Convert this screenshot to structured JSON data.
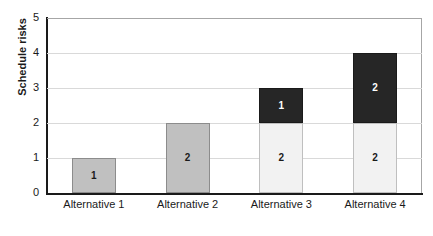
{
  "chart_data": {
    "type": "bar",
    "title": "",
    "xlabel": "",
    "ylabel": "Schedule risks",
    "ylim": [
      0,
      5
    ],
    "yticks": [
      "0",
      "1",
      "2",
      "3",
      "4",
      "5"
    ],
    "grid": true,
    "legend": "none",
    "stacked": true,
    "categories": [
      "Alternative 1",
      "Alternative 2",
      "Alternative 3",
      "Alternative 4"
    ],
    "series": [
      {
        "name": "lower",
        "values": [
          1,
          2,
          2,
          2
        ],
        "labels": [
          "1",
          "2",
          "2",
          "2"
        ]
      },
      {
        "name": "upper",
        "values": [
          0,
          0,
          1,
          2
        ],
        "labels": [
          "",
          "",
          "1",
          "2"
        ]
      }
    ],
    "totals": [
      1,
      2,
      3,
      4
    ],
    "bars": [
      {
        "category": "Alternative 1",
        "total": 1,
        "segments": [
          {
            "value": 1,
            "label": "1",
            "style": "gray"
          }
        ]
      },
      {
        "category": "Alternative 2",
        "total": 2,
        "segments": [
          {
            "value": 2,
            "label": "2",
            "style": "gray"
          }
        ]
      },
      {
        "category": "Alternative 3",
        "total": 3,
        "segments": [
          {
            "value": 2,
            "label": "2",
            "style": "light"
          },
          {
            "value": 1,
            "label": "1",
            "style": "dark"
          }
        ]
      },
      {
        "category": "Alternative 4",
        "total": 4,
        "segments": [
          {
            "value": 2,
            "label": "2",
            "style": "light"
          },
          {
            "value": 2,
            "label": "2",
            "style": "dark"
          }
        ]
      }
    ],
    "colors": {
      "gray": "#c0c0c0",
      "light": "#f2f2f2",
      "dark": "#262626",
      "gridline": "#d9d9d9",
      "axis": "#1a1a1a",
      "frame": "#a6a6a6"
    }
  }
}
